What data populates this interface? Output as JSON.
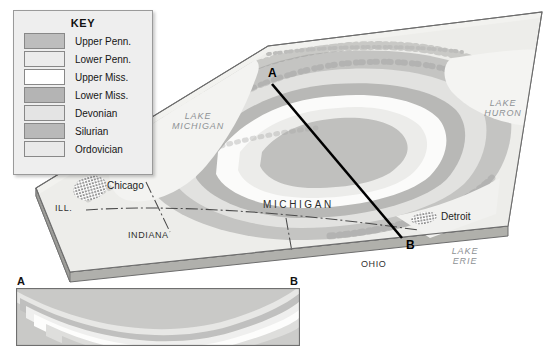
{
  "figure": {
    "type": "geologic-block-diagram"
  },
  "key": {
    "title": "KEY",
    "items": [
      {
        "label": "Upper Penn.",
        "color": "#bdbdbd"
      },
      {
        "label": "Lower Penn.",
        "color": "#ececec"
      },
      {
        "label": "Upper Miss.",
        "color": "#ffffff"
      },
      {
        "label": "Lower Miss.",
        "color": "#b4b4b4"
      },
      {
        "label": "Devonian",
        "color": "#e4e4e4"
      },
      {
        "label": "Silurian",
        "color": "#b9b9b9"
      },
      {
        "label": "Ordovician",
        "color": "#e9e9e9"
      }
    ]
  },
  "map": {
    "states": [
      {
        "name": "WIS.",
        "style": "state"
      },
      {
        "name": "ILL.",
        "style": "state"
      },
      {
        "name": "INDIANA",
        "style": "state"
      },
      {
        "name": "OHIO",
        "style": "state"
      },
      {
        "name": "MICHIGAN",
        "style": "state-big"
      }
    ],
    "lakes": [
      {
        "name": "LAKE MICHIGAN",
        "line1": "LAKE",
        "line2": "MICHIGAN"
      },
      {
        "name": "LAKE HURON",
        "line1": "LAKE",
        "line2": "HURON"
      },
      {
        "name": "LAKE ERIE",
        "line1": "LAKE",
        "line2": "ERIE"
      }
    ],
    "cities": [
      {
        "name": "Chicago"
      },
      {
        "name": "Detroit"
      }
    ],
    "section_line": {
      "start_label": "A",
      "end_label": "B"
    }
  },
  "cross_section": {
    "start_label": "A",
    "end_label": "B",
    "structure": "syncline-basin",
    "layers": [
      {
        "unit": "Upper Penn.",
        "color": "#bdbdbd"
      },
      {
        "unit": "Lower Penn.",
        "color": "#ececec"
      },
      {
        "unit": "Upper Miss.",
        "color": "#ffffff"
      },
      {
        "unit": "Lower Miss.",
        "color": "#b4b4b4"
      },
      {
        "unit": "Devonian",
        "color": "#e4e4e4"
      },
      {
        "unit": "Silurian",
        "color": "#b9b9b9"
      },
      {
        "unit": "Ordovician",
        "color": "#e9e9e9"
      }
    ]
  },
  "colors": {
    "block_top": "#efefec",
    "block_side": "#b6b6b2",
    "outline": "#6d6d6d",
    "section_line": "#000000",
    "lake_text": "#8d9194"
  }
}
